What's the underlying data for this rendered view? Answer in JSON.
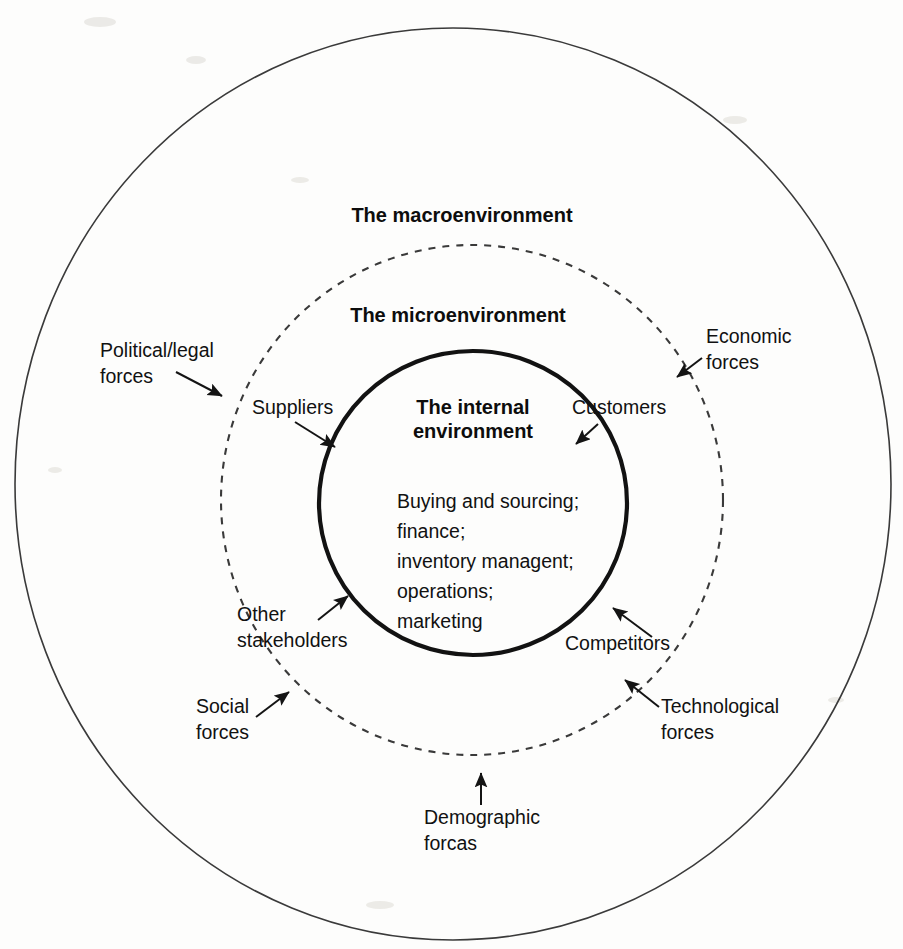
{
  "diagram": {
    "type": "concentric-rings",
    "background_color": "#fdfdfc",
    "line_color": "#141414"
  },
  "rings": {
    "outer": {
      "label": "The macroenvironment",
      "style": "solid",
      "cx": 453,
      "cy": 484,
      "rx": 438,
      "ry": 456,
      "label_x": 462,
      "label_y": 222
    },
    "middle": {
      "label": "The microenvironment",
      "style": "dashed",
      "cx": 472,
      "cy": 500,
      "rx": 251,
      "ry": 255,
      "label_x": 458,
      "label_y": 322
    },
    "inner": {
      "label": "The internal\nenvironment",
      "style": "solid-thick",
      "cx": 473,
      "cy": 503,
      "rx": 154,
      "ry": 152,
      "label_x": 473,
      "label_line1_y": 414,
      "label_line2_y": 438
    }
  },
  "inner_contents": {
    "items": [
      "Buying and  sourcing;",
      "finance;",
      "inventory managent;",
      "operations;",
      "marketing"
    ],
    "start_x": 397,
    "start_y": 508,
    "line_height": 30
  },
  "macro_forces": [
    {
      "id": "political-legal-forces",
      "lines": [
        "Political/legal",
        "forces"
      ],
      "text_x": 100,
      "text_y": 357,
      "arrow_from": [
        176,
        372
      ],
      "arrow_to": [
        222,
        396
      ]
    },
    {
      "id": "economic-forces",
      "lines": [
        "Economic",
        "forces"
      ],
      "text_x": 706,
      "text_y": 343,
      "arrow_from": [
        702,
        358
      ],
      "arrow_to": [
        677,
        377
      ]
    },
    {
      "id": "social-forces",
      "lines": [
        "Social",
        "forces"
      ],
      "text_x": 196,
      "text_y": 713,
      "arrow_from": [
        256,
        717
      ],
      "arrow_to": [
        289,
        692
      ]
    },
    {
      "id": "technological-forces",
      "lines": [
        "Technological",
        "forces"
      ],
      "text_x": 661,
      "text_y": 713,
      "arrow_from": [
        659,
        707
      ],
      "arrow_to": [
        625,
        680
      ]
    },
    {
      "id": "demographic-forces",
      "lines": [
        "Demographic",
        "forcas"
      ],
      "text_x": 424,
      "text_y": 824,
      "arrow_from": [
        481,
        805
      ],
      "arrow_to": [
        481,
        773
      ]
    }
  ],
  "micro_actors": [
    {
      "id": "suppliers",
      "lines": [
        "Suppliers"
      ],
      "text_x": 252,
      "text_y": 414,
      "arrow_from": [
        295,
        422
      ],
      "arrow_to": [
        335,
        447
      ]
    },
    {
      "id": "customers",
      "lines": [
        "Customers"
      ],
      "text_x": 572,
      "text_y": 414,
      "arrow_from": [
        598,
        424
      ],
      "arrow_to": [
        576,
        444
      ]
    },
    {
      "id": "other-stakeholders",
      "lines": [
        "Other",
        "stakeholders"
      ],
      "text_x": 237,
      "text_y": 621,
      "arrow_from": [
        318,
        620
      ],
      "arrow_to": [
        348,
        596
      ]
    },
    {
      "id": "competitors",
      "lines": [
        "Competitors"
      ],
      "text_x": 565,
      "text_y": 650,
      "arrow_from": [
        652,
        637
      ],
      "arrow_to": [
        613,
        608
      ]
    }
  ]
}
